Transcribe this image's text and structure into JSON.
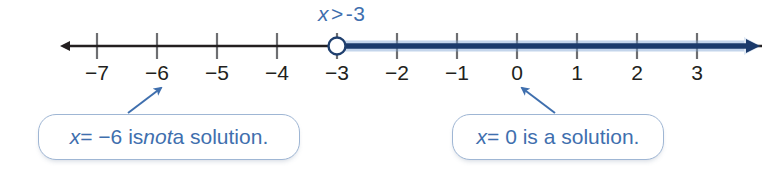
{
  "figure": {
    "title_label": "x > -3",
    "inequality": {
      "variable": "x",
      "operator": ">",
      "value": "-3",
      "color": "#3f6fae"
    }
  },
  "number_line": {
    "min": -7.6,
    "max": 3.75,
    "ticks": [
      {
        "value": -7,
        "label": "−7",
        "x": 97
      },
      {
        "value": -6,
        "label": "−6",
        "x": 157
      },
      {
        "value": -5,
        "label": "−5",
        "x": 217
      },
      {
        "value": -4,
        "label": "−4",
        "x": 277
      },
      {
        "value": -3,
        "label": "−3",
        "x": 337
      },
      {
        "value": -2,
        "label": "−2",
        "x": 397
      },
      {
        "value": -1,
        "label": "−1",
        "x": 457
      },
      {
        "value": 0,
        "label": "0",
        "x": 517
      },
      {
        "value": 1,
        "label": "1",
        "x": 577
      },
      {
        "value": 2,
        "label": "2",
        "x": 637
      },
      {
        "value": 3,
        "label": "3",
        "x": 697
      }
    ],
    "axis_y": 46,
    "endpoint": {
      "value": -3,
      "x": 337,
      "style": "open-circle",
      "included": false
    },
    "solution_ray": {
      "direction": "right",
      "from_x": 337,
      "to_x": 762,
      "color": "#1b3a6b",
      "glow_color": "#6f9ad2"
    },
    "base_line": {
      "from_x": 56,
      "to_x": 762,
      "color": "#231f20"
    },
    "colors": {
      "tick_label": "#231f20",
      "tick_mark": "#6d6e71",
      "axis": "#231f20",
      "solution": "#1b3a6b",
      "accent_blue": "#3f6fae",
      "bubble_border": "#9fb6d4"
    }
  },
  "callouts": [
    {
      "id": "not-a-solution",
      "segments": [
        {
          "text": "x",
          "style": "italic"
        },
        {
          "text": " = −6 is ",
          "style": "normal"
        },
        {
          "text": "not",
          "style": "italic"
        },
        {
          "text": " a solution.",
          "style": "normal"
        }
      ],
      "plain_text": "x = −6 is not a solution.",
      "points_to_value": -6,
      "arrow": {
        "from_x": 128,
        "from_y": 112,
        "to_x": 163,
        "to_y": 87
      }
    },
    {
      "id": "is-a-solution",
      "segments": [
        {
          "text": "x",
          "style": "italic"
        },
        {
          "text": " = 0 is a solution.",
          "style": "normal"
        }
      ],
      "plain_text": "x = 0 is a solution.",
      "points_to_value": 0,
      "arrow": {
        "from_x": 553,
        "from_y": 112,
        "to_x": 521,
        "to_y": 87
      }
    }
  ]
}
